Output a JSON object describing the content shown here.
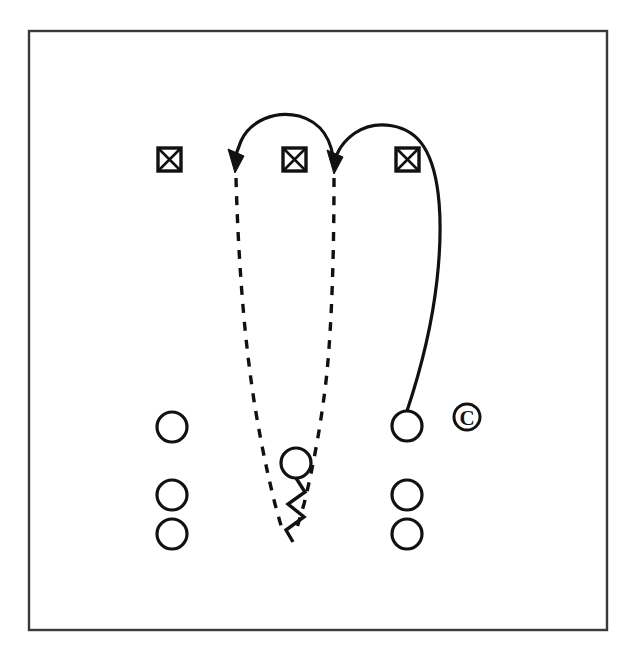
{
  "figure": {
    "kind": "play-diagram",
    "title": "",
    "background_color": "#ffffff",
    "ink_color": "#111111",
    "frame_color": "#3a3a3a",
    "canvas": {
      "width": 638,
      "height": 669
    },
    "frame": {
      "x": 29,
      "y": 31,
      "width": 578,
      "height": 599
    }
  },
  "copyright_mark": {
    "symbol": "©",
    "label": "copyright-mark",
    "cx": 467,
    "cy": 417,
    "radius": 13
  },
  "defenders": [
    {
      "label": "defender-left",
      "symbol": "crossed-square",
      "x": 158,
      "y": 148,
      "size": 23
    },
    {
      "label": "defender-middle",
      "symbol": "crossed-square",
      "x": 283,
      "y": 148,
      "size": 23
    },
    {
      "label": "defender-right",
      "symbol": "crossed-square",
      "x": 396,
      "y": 148,
      "size": 23
    }
  ],
  "players": [
    {
      "label": "offense-left-1",
      "symbol": "circle",
      "cx": 172,
      "cy": 427,
      "r": 15
    },
    {
      "label": "offense-left-2",
      "symbol": "circle",
      "cx": 172,
      "cy": 495,
      "r": 15
    },
    {
      "label": "offense-left-3",
      "symbol": "circle",
      "cx": 172,
      "cy": 534,
      "r": 15
    },
    {
      "label": "offense-center",
      "symbol": "circle",
      "cx": 296,
      "cy": 463,
      "r": 15
    },
    {
      "label": "offense-right-1",
      "symbol": "circle",
      "cx": 407,
      "cy": 426,
      "r": 15
    },
    {
      "label": "offense-right-2",
      "symbol": "circle",
      "cx": 407,
      "cy": 495,
      "r": 15
    },
    {
      "label": "offense-right-3",
      "symbol": "circle",
      "cx": 407,
      "cy": 534,
      "r": 15
    }
  ],
  "routes": [
    {
      "label": "route-left-dashed",
      "style": "dashed",
      "path": "M 236 176 L 245 330 L 262 440 L 272 500 L 281 533",
      "has_arrow": true
    },
    {
      "label": "route-right-dashed",
      "style": "dashed",
      "path": "M 334 176 L 331 330 L 320 440 L 308 500 L 299 528",
      "has_arrow": true
    },
    {
      "label": "route-left-arc",
      "style": "solid-arc",
      "path": "M 333 168 C 330 125 286 112 265 113 C 243 114 230 135 233 160",
      "has_arrow": true,
      "arrow_at": {
        "x": 236,
        "y": 168,
        "angle": 200
      }
    },
    {
      "label": "route-right-arc",
      "style": "solid-arc",
      "path": "M 407 411 C 425 360 437 290 439 236 C 441 180 432 140 404 129 C 375 118 343 135 335 162",
      "has_arrow": true,
      "arrow_at": {
        "x": 334,
        "y": 168,
        "angle": 200
      }
    },
    {
      "label": "route-center-zigzag",
      "style": "zigzag",
      "path": "M 296 479 L 304 491 L 288 503 L 303 516 L 286 530 L 292 541",
      "has_arrow": false
    }
  ]
}
